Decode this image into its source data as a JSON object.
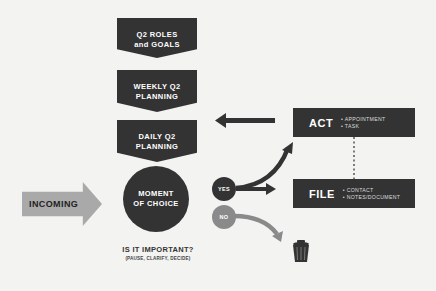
{
  "flow": {
    "steps": [
      {
        "line1": "Q2 ROLES",
        "line2": "and GOALS"
      },
      {
        "line1": "WEEKLY Q2",
        "line2": "PLANNING"
      },
      {
        "line1": "DAILY Q2",
        "line2": "PLANNING"
      }
    ],
    "moment": {
      "line1": "MOMENT",
      "line2": "OF CHOICE"
    },
    "question": "IS IT IMPORTANT?",
    "question_sub": "(PAUSE, CLARIFY, DECIDE)",
    "incoming": "INCOMING"
  },
  "decisions": {
    "yes": "YES",
    "no": "NO"
  },
  "actions": {
    "act": {
      "title": "ACT",
      "items": [
        "• APPOINTMENT",
        "• TASK"
      ]
    },
    "file": {
      "title": "FILE",
      "items": [
        "• CONTACT",
        "• NOTES/DOCUMENT"
      ]
    }
  },
  "icons": {
    "trash": "trash-can-icon"
  },
  "colors": {
    "background": "#f3f3f1",
    "dark": "#333333",
    "incoming_gray": "#a9a9a9",
    "no_gray": "#8a8a8a"
  }
}
